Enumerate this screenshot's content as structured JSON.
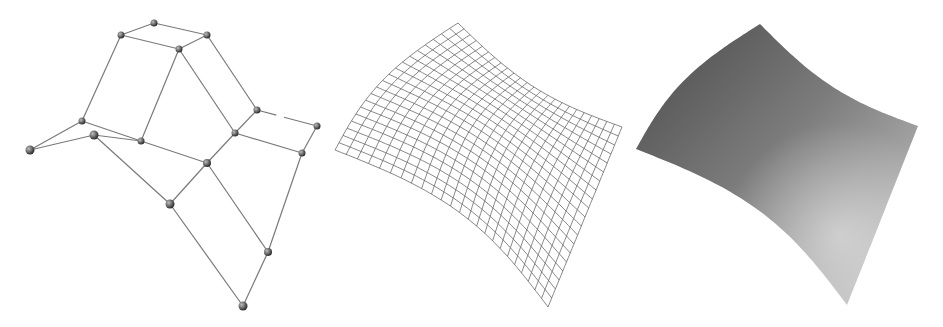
{
  "figure": {
    "width": 943,
    "height": 327,
    "background": "#ffffff",
    "panels": [
      {
        "id": "control-net",
        "kind": "control-polygon",
        "line_color": "#7a7a7a",
        "node_color_light": "#bdbdbd",
        "node_color_dark": "#2e2e2e",
        "nodes": [
          [
            154,
            23
          ],
          [
            121,
            35
          ],
          [
            207,
            35
          ],
          [
            179,
            49
          ],
          [
            82,
            121
          ],
          [
            94,
            135
          ],
          [
            30,
            150
          ],
          [
            141,
            141
          ],
          [
            257,
            110
          ],
          [
            317,
            126
          ],
          [
            235,
            133
          ],
          [
            302,
            153
          ],
          [
            207,
            163
          ],
          [
            170,
            204
          ],
          [
            268,
            252
          ],
          [
            243,
            306
          ]
        ],
        "node_radius": [
          3.5,
          3.5,
          3.5,
          3.5,
          3.5,
          4.5,
          4.5,
          3.5,
          3.5,
          3.5,
          3.5,
          3.5,
          4,
          4.5,
          4,
          4.5
        ],
        "edges": [
          [
            0,
            1
          ],
          [
            0,
            2
          ],
          [
            1,
            3
          ],
          [
            2,
            3
          ],
          [
            1,
            4
          ],
          [
            3,
            7
          ],
          [
            3,
            10
          ],
          [
            2,
            8
          ],
          [
            4,
            6
          ],
          [
            5,
            6
          ],
          [
            4,
            7
          ],
          [
            5,
            7
          ],
          [
            8,
            9
          ],
          [
            8,
            10
          ],
          [
            9,
            11
          ],
          [
            10,
            11
          ],
          [
            7,
            12
          ],
          [
            10,
            12
          ],
          [
            5,
            13
          ],
          [
            12,
            13
          ],
          [
            12,
            14
          ],
          [
            11,
            14
          ],
          [
            13,
            15
          ],
          [
            14,
            15
          ]
        ],
        "dashed_edges": [
          [
            8,
            9
          ]
        ]
      },
      {
        "id": "wireframe-surface",
        "kind": "wireframe",
        "line_color": "#6a6a6a",
        "corners": {
          "top": [
            458,
            23
          ],
          "right": [
            622,
            127
          ],
          "bottom": [
            548,
            307
          ],
          "left": [
            335,
            150
          ]
        },
        "u_lines": 24,
        "v_lines": 20
      },
      {
        "id": "shaded-surface",
        "kind": "shaded",
        "color_dark": "#4a4a4a",
        "color_mid": "#7a7a7a",
        "color_light": "#d0d0d0",
        "corners": {
          "top": [
            760,
            24
          ],
          "right": [
            918,
            126
          ],
          "bottom": [
            847,
            305
          ],
          "left": [
            636,
            149
          ]
        }
      }
    ]
  }
}
